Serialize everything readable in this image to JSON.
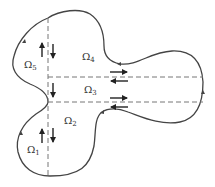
{
  "diagram": {
    "colors": {
      "boundary": "#444444",
      "dashed": "#777777",
      "arrows": "#222222",
      "background": "#ffffff"
    },
    "subdomains": [
      {
        "id": "omega1",
        "symbol": "Ω",
        "subscript": "1"
      },
      {
        "id": "omega2",
        "symbol": "Ω",
        "subscript": "2"
      },
      {
        "id": "omega3",
        "symbol": "Ω",
        "subscript": "3"
      },
      {
        "id": "omega4",
        "symbol": "Ω",
        "subscript": "4"
      },
      {
        "id": "omega5",
        "symbol": "Ω",
        "subscript": "5"
      }
    ]
  }
}
